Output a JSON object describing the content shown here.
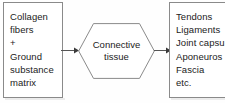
{
  "diagram": {
    "type": "flow",
    "orientation": "left-to-right",
    "colors": {
      "background": "#fefefe",
      "border": "#8a8a8a",
      "text": "#222222",
      "arrow": "#555555"
    },
    "inputs_box": {
      "name": "components",
      "lines": [
        "Collagen",
        "fibers",
        "+",
        "Ground",
        "substance",
        "matrix"
      ]
    },
    "center_node": {
      "name": "connective-tissue",
      "shape": "hexagon",
      "lines": [
        "Connective",
        "tissue"
      ]
    },
    "outputs_box": {
      "name": "tissue-types",
      "lines": [
        "Tendons",
        "Ligaments",
        "Joint capsu",
        "Aponeuros",
        "Fascia",
        "etc."
      ]
    },
    "arrows": [
      {
        "name": "arrow-left",
        "from": "components",
        "to": "connective-tissue",
        "direction": "right"
      },
      {
        "name": "arrow-right",
        "from": "connective-tissue",
        "to": "tissue-types",
        "direction": "right"
      }
    ]
  }
}
